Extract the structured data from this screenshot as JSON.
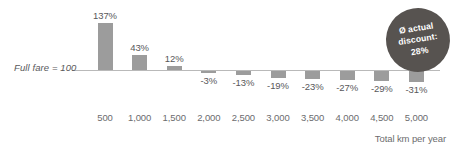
{
  "chart_data": {
    "type": "bar",
    "title": "",
    "subtitle": "",
    "xlabel": "Total km per year",
    "ylabel": "",
    "baseline_label": "Full fare = 100",
    "baseline_value": 0,
    "grid": false,
    "legend": "none",
    "categories": [
      "500",
      "1,000",
      "1,500",
      "2,000",
      "2,500",
      "3,000",
      "3,500",
      "4,000",
      "4,500",
      "5,000"
    ],
    "values": [
      137,
      43,
      12,
      -3,
      -13,
      -19,
      -23,
      -27,
      -29,
      -31
    ],
    "data_labels": [
      "137%",
      "43%",
      "12%",
      "-3%",
      "-13%",
      "-19%",
      "-23%",
      "-27%",
      "-29%",
      "-31%"
    ],
    "ylim": [
      -40,
      150
    ],
    "annotation": {
      "line1": "Ø actual",
      "line2": "discount:",
      "line3": "28%"
    }
  },
  "colors": {
    "bar": "#9c9c9c",
    "badge": "#575350",
    "badge_text": "#ffffff",
    "axis_text": "#6c6c6e",
    "baseline": "#b9b9b9",
    "background": "#ffffff"
  }
}
